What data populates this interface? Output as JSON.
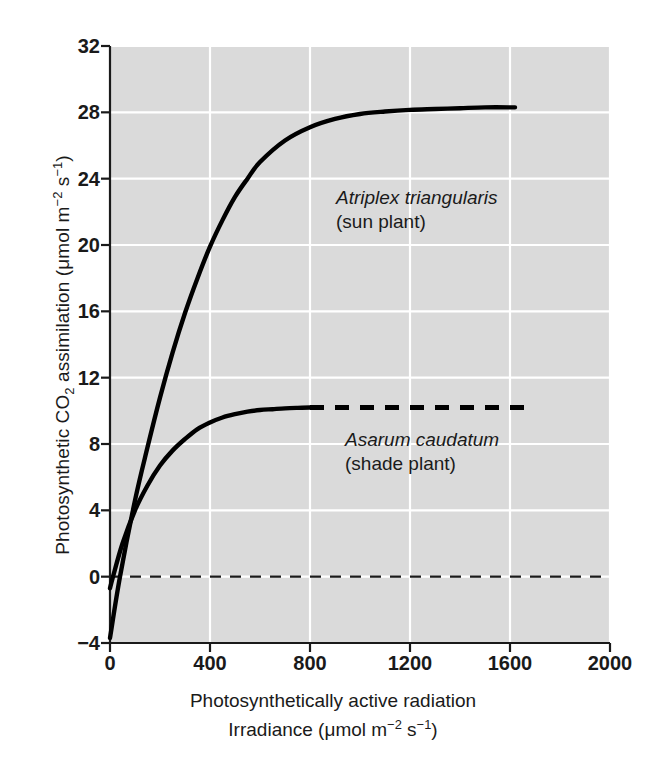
{
  "figure": {
    "background_color": "#ffffff",
    "plot_background_color": "#dadada",
    "gridline_color": "#ffffff",
    "axis_color": "#1a1a1a",
    "curve_color": "#000000"
  },
  "axes": {
    "y_title_parts": {
      "pre": "Photosynthetic CO",
      "sub": "2",
      "mid": " assimilation (μmol m",
      "sup1": "−2",
      "mid2": " s",
      "sup2": "−1",
      "post": ")"
    },
    "y_title_plain": "Photosynthetic CO2 assimilation (μmol m-2 s-1)",
    "x_title_line1": "Photosynthetically active radiation",
    "x_title_line2_parts": {
      "pre": "Irradiance (μmol m",
      "sup1": "−2",
      "mid": " s",
      "sup2": "−1",
      "post": ")"
    },
    "x_title_line2_plain": "Irradiance (μmol m-2 s-1)",
    "y_ticks": [
      32,
      28,
      24,
      20,
      16,
      12,
      8,
      4,
      0,
      -4
    ],
    "y_tick_labels": [
      "32",
      "28",
      "24",
      "20",
      "16",
      "12",
      "8",
      "4",
      "0",
      "−4"
    ],
    "x_ticks": [
      0,
      400,
      800,
      1200,
      1600,
      2000
    ],
    "x_tick_labels": [
      "0",
      "400",
      "800",
      "1200",
      "1600",
      "2000"
    ],
    "ylim": [
      -4,
      32
    ],
    "xlim": [
      0,
      2000
    ],
    "grid": true,
    "legend_position": "inline-annotation"
  },
  "annotations": {
    "sun": {
      "species": "Atriplex triangularis",
      "common": "(sun plant)"
    },
    "shade": {
      "species": "Asarum caudatum",
      "common": "(shade plant)"
    }
  },
  "chart_data": {
    "type": "line",
    "title": "",
    "xlabel": "Photosynthetically active radiation / Irradiance (μmol m-2 s-1)",
    "ylabel": "Photosynthetic CO2 assimilation (μmol m-2 s-1)",
    "xlim": [
      0,
      2000
    ],
    "ylim": [
      -4,
      32
    ],
    "grid": true,
    "zero_reference_line": {
      "value": 0,
      "style": "dashed",
      "x_from": 0,
      "x_to": 2000
    },
    "series": [
      {
        "name": "Atriplex triangularis (sun plant)",
        "label": "sun plant",
        "style": "solid",
        "light_compensation_point": 40,
        "dark_respiration": -3.7,
        "saturation_value": 28.3,
        "x": [
          0,
          40,
          100,
          150,
          200,
          250,
          300,
          350,
          400,
          450,
          500,
          550,
          600,
          700,
          800,
          900,
          1000,
          1100,
          1200,
          1300,
          1400,
          1500,
          1620
        ],
        "y": [
          -3.7,
          0.0,
          4.6,
          7.8,
          10.8,
          13.5,
          15.9,
          18.0,
          19.9,
          21.5,
          22.9,
          24.0,
          25.0,
          26.3,
          27.1,
          27.6,
          27.9,
          28.05,
          28.15,
          28.2,
          28.25,
          28.3,
          28.3
        ]
      },
      {
        "name": "Asarum caudatum (shade plant)",
        "label": "shade plant",
        "style": "solid-then-dashed",
        "solid_until_x": 800,
        "dashed_from_x": 800,
        "dashed_to_x": 1700,
        "light_compensation_point": 12,
        "dark_respiration": -0.7,
        "saturation_value": 10.2,
        "x": [
          0,
          12,
          50,
          100,
          150,
          200,
          250,
          300,
          350,
          400,
          450,
          500,
          550,
          600,
          650,
          700,
          750,
          800,
          1000,
          1200,
          1400,
          1600,
          1700
        ],
        "y": [
          -0.7,
          0.0,
          2.0,
          4.0,
          5.5,
          6.7,
          7.6,
          8.3,
          8.9,
          9.3,
          9.6,
          9.8,
          9.95,
          10.05,
          10.1,
          10.15,
          10.18,
          10.2,
          10.2,
          10.2,
          10.2,
          10.2,
          10.2
        ]
      }
    ],
    "crossover_point": {
      "x": 140,
      "y": 5.3
    }
  }
}
